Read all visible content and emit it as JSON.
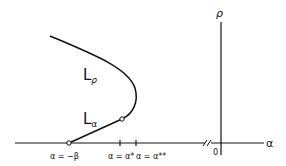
{
  "diagram": {
    "axes": {
      "horizontal_label": "α",
      "vertical_label": "ρ",
      "origin_label": "0"
    },
    "curve_labels": {
      "upper_branch": "L",
      "upper_branch_sub": "ρ",
      "lower_branch": "L",
      "lower_branch_sub": "α"
    },
    "tick_labels": {
      "beta": "α = −β",
      "alpha_star": "α = α*",
      "alpha_double_star": "α = α**"
    },
    "colors": {
      "ink": "#111111",
      "background": "#ffffff"
    }
  }
}
